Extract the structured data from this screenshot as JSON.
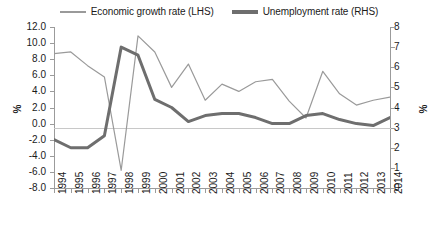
{
  "chart_data": {
    "type": "line",
    "title": "",
    "xlabel": "",
    "ylabel": "%",
    "ylabel_right": "%",
    "grid": false,
    "legend_position": "top-center",
    "categories": [
      "1994",
      "1995",
      "1996",
      "1997",
      "1998",
      "1999",
      "2000",
      "2001",
      "2002",
      "2003",
      "2004",
      "2005",
      "2006",
      "2007",
      "2008",
      "2009",
      "2010",
      "2011",
      "2012",
      "2013",
      "2014"
    ],
    "ylim": [
      -8.0,
      12.0
    ],
    "yticks": [
      "12.0",
      "10.0",
      "8.0",
      "6.0",
      "4.0",
      "2.0",
      "0.0",
      "-2.0",
      "-4.0",
      "-6.0",
      "-8.0"
    ],
    "ylim_right": [
      0,
      8
    ],
    "yticks_right": [
      "8",
      "7",
      "6",
      "5",
      "4",
      "3",
      "2",
      "1",
      "0"
    ],
    "series": [
      {
        "name": "Economic growth rate (LHS)",
        "axis": "left",
        "color": "#9a9a9a",
        "width": 1.2,
        "values": [
          8.7,
          8.9,
          7.2,
          5.8,
          -5.8,
          10.9,
          8.9,
          4.5,
          7.4,
          2.9,
          4.9,
          4.0,
          5.2,
          5.5,
          2.8,
          0.7,
          6.5,
          3.7,
          2.3,
          2.9,
          3.3
        ]
      },
      {
        "name": "Unemployment rate (RHS)",
        "axis": "right",
        "color": "#6e6e6e",
        "width": 3.0,
        "values": [
          2.4,
          2.0,
          2.0,
          2.6,
          7.0,
          6.6,
          4.4,
          4.0,
          3.3,
          3.6,
          3.7,
          3.7,
          3.5,
          3.2,
          3.2,
          3.6,
          3.7,
          3.4,
          3.2,
          3.1,
          3.5
        ]
      }
    ]
  }
}
